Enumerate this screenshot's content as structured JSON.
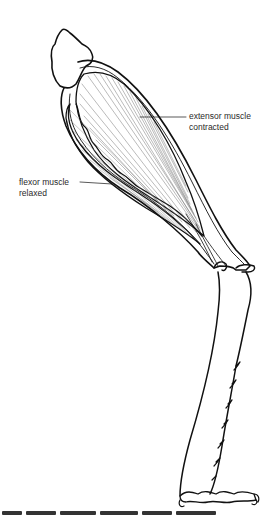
{
  "diagram": {
    "labels": {
      "extensor": {
        "line1": "extensor muscle",
        "line2": "contracted"
      },
      "flexor": {
        "line1": "flexor muscle",
        "line2": "relaxed"
      }
    },
    "caption_truncated": true,
    "colors": {
      "ink": "#111111",
      "label_text": "#2a2a2a",
      "background": "#ffffff"
    }
  }
}
